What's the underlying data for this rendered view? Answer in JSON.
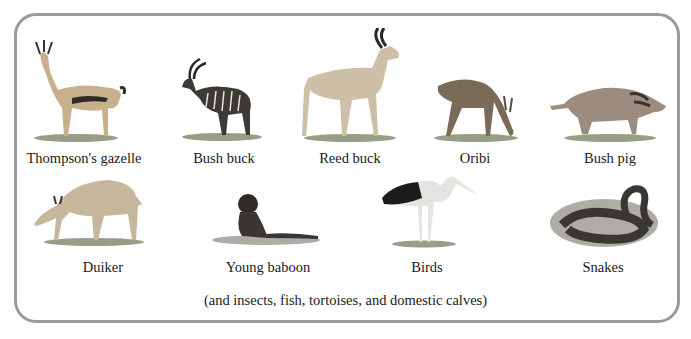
{
  "figure": {
    "animals": [
      {
        "name": "Thompson's gazelle",
        "icon": "gazelle-illustration"
      },
      {
        "name": "Bush buck",
        "icon": "bushbuck-illustration"
      },
      {
        "name": "Reed buck",
        "icon": "reedbuck-illustration"
      },
      {
        "name": "Oribi",
        "icon": "oribi-illustration"
      },
      {
        "name": "Bush pig",
        "icon": "bushpig-illustration"
      },
      {
        "name": "Duiker",
        "icon": "duiker-illustration"
      },
      {
        "name": "Young baboon",
        "icon": "baboon-illustration"
      },
      {
        "name": "Birds",
        "icon": "stork-illustration"
      },
      {
        "name": "Snakes",
        "icon": "snake-illustration"
      }
    ],
    "footnote": "(and insects, fish, tortoises, and domestic calves)"
  },
  "colors": {
    "frame_border": "#9a9a9a",
    "grass": "#6f7a5a",
    "fur_light": "#c9b89a",
    "fur_dark": "#3d3a36"
  }
}
